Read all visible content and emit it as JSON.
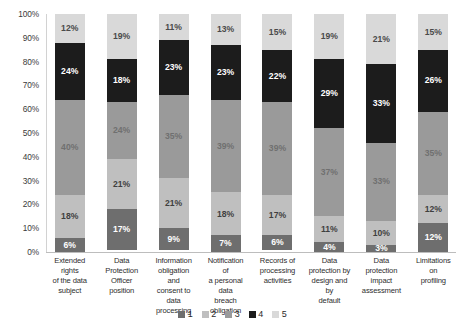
{
  "chart_data": {
    "type": "bar",
    "subtype": "stacked-100-percent",
    "title": "",
    "xlabel": "",
    "ylabel": "",
    "ylim": [
      0,
      100
    ],
    "grid": false,
    "legend_position": "bottom",
    "categories": [
      "Extended rights of the data subject",
      "Data Protection Officer position",
      "Information obligation and consent to data processing",
      "Notification of a personal data breach obligation",
      "Records of processing activities",
      "Data protection by design and by default",
      "Data protection impact assessment",
      "Limitations on profiling"
    ],
    "category_lines": [
      [
        "Extended rights",
        "of the data",
        "subject"
      ],
      [
        "Data",
        "Protection",
        "Officer position"
      ],
      [
        "Information",
        "obligation and",
        "consent to data",
        "processing"
      ],
      [
        "Notification of",
        "a personal data",
        "breach",
        "obligation"
      ],
      [
        "Records of",
        "processing",
        "activities"
      ],
      [
        "Data",
        "protection by",
        "design and by",
        "default"
      ],
      [
        "Data",
        "protection",
        "impact",
        "assessment"
      ],
      [
        "Limitations on",
        "profiling"
      ]
    ],
    "series": [
      {
        "name": "1",
        "color": "#6e6e6e",
        "label_color": "#ffffff",
        "values": [
          6,
          17,
          9,
          7,
          6,
          4,
          3,
          12
        ],
        "labels": [
          "6%",
          "17%",
          "9%",
          "7%",
          "6%",
          "4%",
          "3%",
          "12%"
        ]
      },
      {
        "name": "2",
        "color": "#bfbfbf",
        "label_color": "#3f3f3f",
        "values": [
          18,
          21,
          21,
          18,
          17,
          11,
          10,
          12
        ],
        "labels": [
          "18%",
          "21%",
          "21%",
          "18%",
          "17%",
          "11%",
          "10%",
          "12%"
        ]
      },
      {
        "name": "3",
        "color": "#9a9a9a",
        "label_color": "#707070",
        "values": [
          40,
          24,
          35,
          39,
          39,
          37,
          33,
          35
        ],
        "labels": [
          "40%",
          "24%",
          "35%",
          "39%",
          "39%",
          "37%",
          "33%",
          "35%"
        ]
      },
      {
        "name": "4",
        "color": "#1c1c1c",
        "label_color": "#ffffff",
        "values": [
          24,
          18,
          23,
          23,
          22,
          29,
          33,
          26
        ],
        "labels": [
          "24%",
          "18%",
          "23%",
          "23%",
          "22%",
          "29%",
          "33%",
          "26%"
        ]
      },
      {
        "name": "5",
        "color": "#d9d9d9",
        "label_color": "#4a4a4a",
        "values": [
          12,
          19,
          11,
          13,
          15,
          19,
          21,
          15
        ],
        "labels": [
          "12%",
          "19%",
          "11%",
          "13%",
          "15%",
          "19%",
          "21%",
          "15%"
        ]
      }
    ],
    "y_ticks": [
      "0%",
      "10%",
      "20%",
      "30%",
      "40%",
      "50%",
      "60%",
      "70%",
      "80%",
      "90%",
      "100%"
    ],
    "legend": [
      {
        "label": "1",
        "color": "#6e6e6e"
      },
      {
        "label": "2",
        "color": "#bfbfbf"
      },
      {
        "label": "3",
        "color": "#9a9a9a"
      },
      {
        "label": "4",
        "color": "#1c1c1c"
      },
      {
        "label": "5",
        "color": "#d9d9d9"
      }
    ]
  }
}
